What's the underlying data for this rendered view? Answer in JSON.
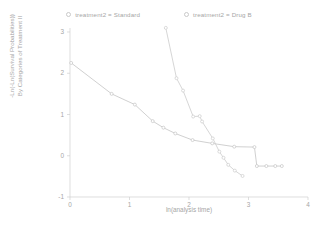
{
  "chart_data": {
    "type": "line",
    "title": "",
    "subtitle": "",
    "xlabel": "ln(analysis time)",
    "ylabel_line1": "-Ln(-Ln(Survival Probabilities))",
    "ylabel_line2": "By Categories of Treatment II",
    "xlim": [
      0,
      4
    ],
    "ylim": [
      -1,
      3
    ],
    "xticks": [
      "0",
      "1",
      "2",
      "3",
      "4"
    ],
    "xtick_values": [
      0,
      1,
      2,
      3,
      4
    ],
    "yticks": [
      "3",
      "2",
      "1",
      "0",
      "-1"
    ],
    "ytick_values": [
      3,
      2,
      1,
      0,
      -1
    ],
    "grid": false,
    "legend_position": "top-center",
    "markers": "open-circle",
    "series": [
      {
        "name": "treatment2 = Standard",
        "color": "#c4c4c4",
        "points": [
          [
            0.02,
            2.25
          ],
          [
            0.7,
            1.5
          ],
          [
            1.09,
            1.24
          ],
          [
            1.39,
            0.84
          ],
          [
            1.57,
            0.68
          ],
          [
            1.77,
            0.54
          ],
          [
            2.06,
            0.38
          ],
          [
            2.39,
            0.3
          ],
          [
            2.76,
            0.22
          ],
          [
            3.1,
            0.21
          ],
          [
            3.14,
            -0.25
          ],
          [
            3.3,
            -0.25
          ],
          [
            3.45,
            -0.25
          ],
          [
            3.56,
            -0.25
          ]
        ]
      },
      {
        "name": "treatment2 = Drug B",
        "color": "#cccccc",
        "points": [
          [
            1.61,
            3.1
          ],
          [
            1.79,
            1.88
          ],
          [
            1.9,
            1.58
          ],
          [
            2.07,
            0.95
          ],
          [
            2.18,
            0.96
          ],
          [
            2.22,
            0.83
          ],
          [
            2.4,
            0.42
          ],
          [
            2.51,
            0.1
          ],
          [
            2.58,
            -0.05
          ],
          [
            2.66,
            -0.22
          ],
          [
            2.77,
            -0.36
          ],
          [
            2.9,
            -0.49
          ]
        ]
      }
    ]
  },
  "legend": {
    "entries": [
      {
        "label": "treatment2 = Standard"
      },
      {
        "label": "treatment2 = Drug B"
      }
    ]
  }
}
